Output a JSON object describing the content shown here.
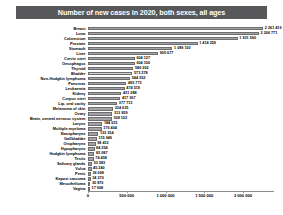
{
  "chart": {
    "title": "Number of new cases in 2020, both sexes, all ages"
  },
  "colors": {
    "title_banner": "#58585a",
    "title_text": "#ffffff",
    "bar_fill": "#a3a3a5",
    "bar_border": "#6d6d6f",
    "bar_highlight": "#cfcfd1",
    "axis": "#8d8d8f",
    "background": "#ffffff"
  },
  "chart_data": {
    "type": "bar",
    "orientation": "horizontal",
    "title": "Number of new cases in 2020, both sexes, all ages",
    "xlabel": "",
    "ylabel": "",
    "xlim": [
      0,
      2400000
    ],
    "grid": false,
    "legend": false,
    "xticks": [
      0,
      500000,
      1000000,
      1500000,
      2000000
    ],
    "xtick_labels": [
      "0",
      "500 000",
      "1 000 000",
      "1 500 000",
      "2 000 000"
    ],
    "categories": [
      "Breast",
      "Lung",
      "Colorectum",
      "Prostate",
      "Stomach",
      "Liver",
      "Cervix uteri",
      "Oesophagus",
      "Thyroid",
      "Bladder",
      "Non-Hodgkin lymphoma",
      "Pancreas",
      "Leukaemia",
      "Kidney",
      "Corpus uteri",
      "Lip, oral cavity",
      "Melanoma of skin",
      "Ovary",
      "Brain, central nervous system",
      "Larynx",
      "Multiple myeloma",
      "Nasopharynx",
      "Gallbladder",
      "Oropharynx",
      "Hypopharynx",
      "Hodgkin lymphoma",
      "Testis",
      "Salivary glands",
      "Vulva",
      "Penis",
      "Kaposi sarcoma",
      "Mesothelioma",
      "Vagina"
    ],
    "values": [
      2261419,
      2206771,
      1931590,
      1414259,
      1089103,
      905677,
      604127,
      604100,
      586202,
      573278,
      544352,
      495773,
      474519,
      431288,
      417367,
      377713,
      324635,
      313959,
      308102,
      184615,
      176404,
      133354,
      115949,
      98412,
      84254,
      83087,
      74458,
      53583,
      45240,
      36068,
      34270,
      30870,
      17908
    ],
    "value_labels": [
      "2 261 419",
      "2 206 771",
      "1 931 590",
      "1 414 259",
      "1 089 103",
      "905 677",
      "604 127",
      "604 100",
      "586 202",
      "573 278",
      "544 352",
      "495 773",
      "474 519",
      "431 288",
      "417 367",
      "377 713",
      "324 635",
      "313 959",
      "308 102",
      "184 615",
      "176 404",
      "133 354",
      "115 949",
      "98 412",
      "84 254",
      "83 087",
      "74 458",
      "53 583",
      "45 240",
      "36 068",
      "34 270",
      "30 870",
      "17 908"
    ],
    "highlight_index": 9
  }
}
